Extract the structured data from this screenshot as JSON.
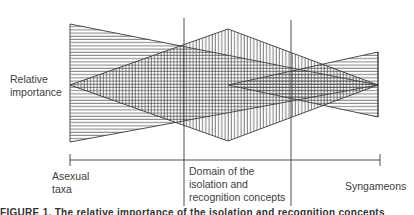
{
  "diagram": {
    "y_axis_label": "Relative\nimportance",
    "x_axis": {
      "left_label": "Asexual\ntaxa",
      "center_label": "Domain of the\nisolation and\nrecognition concepts",
      "right_label": "Syngameons"
    },
    "regions": [
      {
        "name": "left-wedge",
        "hatch": "horizontal",
        "description": "decreasing from left"
      },
      {
        "name": "center-diamond",
        "hatch": "vertical",
        "description": "peaks in the center domain"
      },
      {
        "name": "right-wedge",
        "hatch": "horizontal",
        "description": "increasing toward right"
      }
    ],
    "caption": "FIGURE 1. The relative importance of the isolation and recognition concepts"
  },
  "colors": {
    "line": "#3a3a3a",
    "background": "#ffffff"
  }
}
